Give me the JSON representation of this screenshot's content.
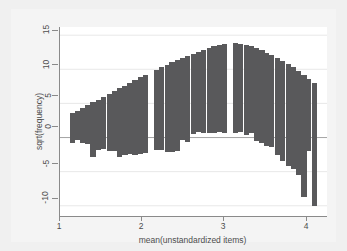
{
  "chart_data": {
    "type": "bar",
    "subtype": "rootogram",
    "title": "",
    "xlabel": "mean(unstandardized items)",
    "ylabel": "sqrt(frequency)",
    "xlim": [
      0.88,
      4.12
    ],
    "ylim": [
      -11.5,
      16.2
    ],
    "xticks": [
      1,
      2,
      3,
      4
    ],
    "xtick_labels": [
      "1",
      "2",
      "3",
      "4"
    ],
    "yticks": [
      15,
      10,
      5,
      0,
      -5,
      -10
    ],
    "ytick_labels": [
      "15",
      "10",
      "5",
      "0",
      "-5",
      "-10"
    ],
    "grid": true,
    "grid_axis": "y",
    "legend": "none",
    "bar_color": "#59595b",
    "reference_line_y": 0,
    "bin_width": 0.0635,
    "x": [
      1.03,
      1.09,
      1.16,
      1.22,
      1.28,
      1.35,
      1.41,
      1.48,
      1.54,
      1.6,
      1.67,
      1.73,
      1.79,
      1.86,
      1.92,
      1.99,
      2.05,
      2.11,
      2.18,
      2.24,
      2.31,
      2.37,
      2.43,
      2.5,
      2.56,
      2.62,
      2.69,
      2.75,
      2.82,
      2.88,
      2.94,
      3.01,
      3.07,
      3.14,
      3.2,
      3.26,
      3.33,
      3.39,
      3.45,
      3.52,
      3.58,
      3.65,
      3.71,
      3.77,
      3.84,
      3.9,
      3.97
    ],
    "expected_normal_curve": [
      3.55,
      3.9,
      4.35,
      4.75,
      5.15,
      5.55,
      5.95,
      6.4,
      6.8,
      7.2,
      7.6,
      8.0,
      8.4,
      8.8,
      9.2,
      9.6,
      9.95,
      10.3,
      10.65,
      11.0,
      11.35,
      11.7,
      12.0,
      12.3,
      12.6,
      12.85,
      13.1,
      13.35,
      13.55,
      13.7,
      13.8,
      13.8,
      13.7,
      13.55,
      13.35,
      13.1,
      12.8,
      12.45,
      12.1,
      11.7,
      11.25,
      10.8,
      10.3,
      9.75,
      9.2,
      8.6,
      8.0
    ],
    "observed_sqrt_frequency": [
      4.3,
      4.3,
      5.1,
      5.75,
      8.0,
      7.35,
      7.6,
      8.35,
      8.8,
      10.0,
      10.2,
      10.45,
      10.9,
      11.2,
      11.5,
      0.0,
      11.8,
      12.2,
      12.7,
      13.1,
      13.35,
      12.0,
      12.6,
      11.8,
      11.75,
      12.2,
      12.45,
      12.65,
      12.75,
      13.1,
      0.0,
      13.1,
      12.9,
      13.2,
      12.7,
      13.6,
      13.55,
      13.7,
      13.5,
      14.3,
      14.7,
      14.9,
      14.9,
      15.2,
      17.9,
      10.6,
      18.0
    ],
    "bar_bottom_residual": [
      -0.75,
      -0.4,
      -0.75,
      -1.0,
      -2.85,
      -1.8,
      -1.65,
      -1.95,
      -2.0,
      -2.8,
      -2.6,
      -2.45,
      -2.5,
      -2.4,
      -2.3,
      0.0,
      -1.85,
      -1.9,
      -2.05,
      -2.1,
      -2.0,
      -0.3,
      -0.6,
      0.5,
      0.85,
      0.65,
      0.65,
      0.7,
      0.8,
      0.6,
      0.0,
      0.7,
      0.8,
      0.35,
      0.65,
      -0.5,
      -0.75,
      -1.25,
      -1.4,
      -2.6,
      -3.45,
      -4.1,
      -4.6,
      -5.45,
      -8.7,
      -2.0,
      -10.0
    ]
  },
  "axis": {
    "y_title": "sqrt(frequency)",
    "x_title": "mean(unstandardized items)"
  }
}
